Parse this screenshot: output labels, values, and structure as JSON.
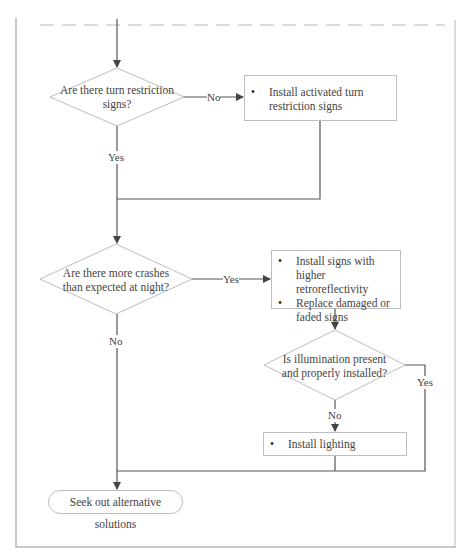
{
  "flowchart": {
    "decisions": [
      {
        "id": "d1",
        "text": [
          "Are there turn restriction",
          "signs?"
        ]
      },
      {
        "id": "d2",
        "text": [
          "Are there more crashes",
          "than expected at night?"
        ]
      },
      {
        "id": "d3",
        "text": [
          "Is illumination present",
          "and properly installed?"
        ]
      }
    ],
    "actions": [
      {
        "id": "a1",
        "items": [
          "Install activated turn restriction signs"
        ]
      },
      {
        "id": "a2",
        "items": [
          "Install signs with higher retroreflectivity",
          "Replace damaged or faded signs"
        ]
      },
      {
        "id": "a3",
        "items": [
          "Install lighting"
        ]
      }
    ],
    "terminal": {
      "text": "Seek out alternative solutions"
    },
    "edge_labels": {
      "d1_no": "No",
      "d1_yes": "Yes",
      "d2_yes": "Yes",
      "d2_no": "No",
      "d3_no": "No",
      "d3_yes": "Yes"
    },
    "colors": {
      "line": "#555555",
      "shape_border": "#bdbdbd",
      "frame": "#c8c8c8",
      "dash": "#d0d0d0"
    }
  }
}
